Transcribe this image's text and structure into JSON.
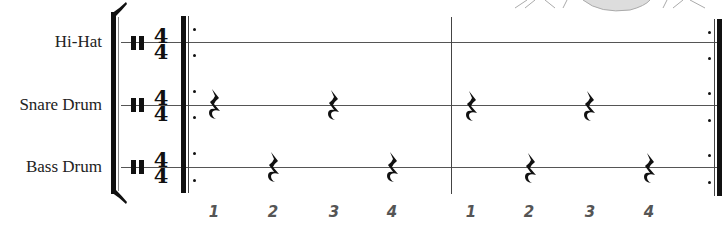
{
  "score": {
    "instruments": [
      {
        "label": "Hi-Hat",
        "y": 42
      },
      {
        "label": "Snare Drum",
        "y": 105
      },
      {
        "label": "Bass Drum",
        "y": 167
      }
    ],
    "time_signature": {
      "top": "4",
      "bottom": "4"
    },
    "clef": "percussion-clef",
    "repeat": {
      "start": true,
      "end": true
    },
    "measures": 2,
    "rests": {
      "snare": [
        {
          "measure": 1,
          "beat": 1
        },
        {
          "measure": 1,
          "beat": 3
        },
        {
          "measure": 2,
          "beat": 1
        },
        {
          "measure": 2,
          "beat": 3
        }
      ],
      "bass": [
        {
          "measure": 1,
          "beat": 2
        },
        {
          "measure": 1,
          "beat": 4
        },
        {
          "measure": 2,
          "beat": 2
        },
        {
          "measure": 2,
          "beat": 4
        }
      ]
    },
    "beat_counts": [
      "1",
      "2",
      "3",
      "4",
      "1",
      "2",
      "3",
      "4"
    ],
    "colors": {
      "ink": "#111111",
      "staff": "#555555",
      "count_text": "#555555"
    }
  }
}
